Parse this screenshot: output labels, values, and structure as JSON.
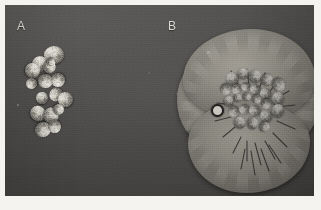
{
  "figure": {
    "kind": "grayscale-photograph",
    "background_color": "#4a4947",
    "border_color": "#f4f3f0",
    "panels": [
      {
        "id": "A",
        "label": "A",
        "label_color": "#d9d7d1",
        "label_x": 17,
        "label_y": 20,
        "content": "compact cluster of discrete rounded wrinkled colonies",
        "colony_color": "#d5d1c7",
        "colony_count": 16
      },
      {
        "id": "B",
        "label": "B",
        "label_color": "#d9d7d1",
        "label_x": 168,
        "label_y": 20,
        "content": "large confluent spreading lobed colony mass with dense wrinkled centre and radial cracks",
        "colony_color": "#908d84",
        "colony_count": 22
      }
    ],
    "markers": [
      {
        "name": "ring-artifact",
        "x": 215,
        "y": 108,
        "size": 9
      },
      {
        "name": "bright-speck-upper",
        "x": 207,
        "y": 51,
        "size": 3
      },
      {
        "name": "bright-speck-left",
        "x": 17,
        "y": 104,
        "size": 2
      },
      {
        "name": "faint-speck-mid",
        "x": 148,
        "y": 72,
        "size": 2
      },
      {
        "name": "faint-speck-right",
        "x": 176,
        "y": 93,
        "size": 2
      }
    ],
    "colonies_a": [
      {
        "x": 44,
        "y": 46,
        "w": 20,
        "h": 18
      },
      {
        "x": 32,
        "y": 56,
        "w": 15,
        "h": 16
      },
      {
        "x": 25,
        "y": 63,
        "w": 15,
        "h": 15
      },
      {
        "x": 43,
        "y": 61,
        "w": 13,
        "h": 12
      },
      {
        "x": 47,
        "y": 58,
        "w": 8,
        "h": 8
      },
      {
        "x": 38,
        "y": 74,
        "w": 15,
        "h": 14
      },
      {
        "x": 51,
        "y": 73,
        "w": 14,
        "h": 14
      },
      {
        "x": 26,
        "y": 78,
        "w": 11,
        "h": 11
      },
      {
        "x": 49,
        "y": 88,
        "w": 14,
        "h": 13
      },
      {
        "x": 58,
        "y": 92,
        "w": 15,
        "h": 15
      },
      {
        "x": 36,
        "y": 92,
        "w": 12,
        "h": 12
      },
      {
        "x": 30,
        "y": 106,
        "w": 16,
        "h": 15
      },
      {
        "x": 43,
        "y": 108,
        "w": 16,
        "h": 15
      },
      {
        "x": 53,
        "y": 104,
        "w": 11,
        "h": 11
      },
      {
        "x": 35,
        "y": 122,
        "w": 16,
        "h": 15
      },
      {
        "x": 48,
        "y": 120,
        "w": 13,
        "h": 13
      }
    ],
    "colonies_b": [
      {
        "x": 226,
        "y": 72,
        "w": 13,
        "h": 13
      },
      {
        "x": 238,
        "y": 68,
        "w": 11,
        "h": 11
      },
      {
        "x": 249,
        "y": 70,
        "w": 13,
        "h": 13
      },
      {
        "x": 261,
        "y": 74,
        "w": 12,
        "h": 12
      },
      {
        "x": 272,
        "y": 78,
        "w": 13,
        "h": 14
      },
      {
        "x": 220,
        "y": 84,
        "w": 11,
        "h": 11
      },
      {
        "x": 231,
        "y": 84,
        "w": 10,
        "h": 10
      },
      {
        "x": 241,
        "y": 82,
        "w": 9,
        "h": 9
      },
      {
        "x": 250,
        "y": 84,
        "w": 10,
        "h": 10
      },
      {
        "x": 260,
        "y": 88,
        "w": 11,
        "h": 11
      },
      {
        "x": 272,
        "y": 92,
        "w": 12,
        "h": 13
      },
      {
        "x": 224,
        "y": 96,
        "w": 10,
        "h": 10
      },
      {
        "x": 234,
        "y": 94,
        "w": 8,
        "h": 8
      },
      {
        "x": 243,
        "y": 93,
        "w": 8,
        "h": 8
      },
      {
        "x": 252,
        "y": 95,
        "w": 9,
        "h": 9
      },
      {
        "x": 261,
        "y": 99,
        "w": 10,
        "h": 10
      },
      {
        "x": 228,
        "y": 106,
        "w": 11,
        "h": 11
      },
      {
        "x": 239,
        "y": 104,
        "w": 10,
        "h": 10
      },
      {
        "x": 249,
        "y": 105,
        "w": 11,
        "h": 11
      },
      {
        "x": 260,
        "y": 110,
        "w": 12,
        "h": 12
      },
      {
        "x": 272,
        "y": 104,
        "w": 12,
        "h": 13
      },
      {
        "x": 234,
        "y": 117,
        "w": 12,
        "h": 11
      },
      {
        "x": 247,
        "y": 118,
        "w": 12,
        "h": 11
      },
      {
        "x": 259,
        "y": 122,
        "w": 11,
        "h": 10
      }
    ],
    "cracks": [
      "M 54 42 L 62 58",
      "M 70 40 L 72 58",
      "M 88 44 L 82 60",
      "M 100 52 L 92 64",
      "M 112 62 L 98 70",
      "M 118 76 L 100 78",
      "M 46 56 L 60 64",
      "M 40 74 L 56 76",
      "M 38 92 L 54 88",
      "M 46 108 L 58 98",
      "M 56 124 L 64 108",
      "M 70 132 L 70 112",
      "M 84 136 L 78 114",
      "M 98 130 L 88 112",
      "M 110 118 L 96 104",
      "M 118 100 L 100 92",
      "M 64 140 L 68 120",
      "M 78 146 L 74 122",
      "M 92 142 L 84 120",
      "M 104 134 L 92 116"
    ]
  }
}
